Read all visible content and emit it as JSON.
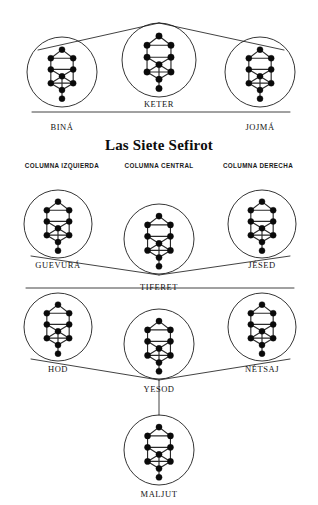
{
  "title": "Las Siete Sefirot",
  "colors": {
    "background": "#ffffff",
    "ink": "#121212",
    "node_fill": "#0a0a0a"
  },
  "column_headers": [
    {
      "id": "left",
      "label": "COLUMNA IZQUIERDA",
      "x": 62,
      "y": 168
    },
    {
      "id": "center",
      "label": "COLUMNA CENTRAL",
      "x": 159,
      "y": 168
    },
    {
      "id": "right",
      "label": "COLUMNA DERECHA",
      "x": 258,
      "y": 168
    }
  ],
  "sefirot": [
    {
      "id": "bina",
      "label": "BINÁ",
      "column": "left",
      "cx": 62,
      "cy": 72,
      "r": 35,
      "tree_scale": 0.86,
      "label_x": 62,
      "label_y": 130
    },
    {
      "id": "keter",
      "label": "KETER",
      "column": "center",
      "cx": 159,
      "cy": 60,
      "r": 37,
      "tree_scale": 0.92,
      "label_x": 159,
      "label_y": 107
    },
    {
      "id": "jojma",
      "label": "JOJMÁ",
      "column": "right",
      "cx": 260,
      "cy": 72,
      "r": 35,
      "tree_scale": 0.86,
      "label_x": 260,
      "label_y": 130
    },
    {
      "id": "guevura",
      "label": "GUEVURÁ",
      "column": "left",
      "cx": 58,
      "cy": 224,
      "r": 34,
      "tree_scale": 0.86,
      "label_x": 58,
      "label_y": 268
    },
    {
      "id": "tiferet",
      "label": "TIFERET",
      "column": "center",
      "cx": 159,
      "cy": 239,
      "r": 35,
      "tree_scale": 0.88,
      "label_x": 159,
      "label_y": 290
    },
    {
      "id": "jesed",
      "label": "JÉSED",
      "column": "right",
      "cx": 262,
      "cy": 224,
      "r": 34,
      "tree_scale": 0.86,
      "label_x": 262,
      "label_y": 268
    },
    {
      "id": "hod",
      "label": "HOD",
      "column": "left",
      "cx": 58,
      "cy": 327,
      "r": 34,
      "tree_scale": 0.86,
      "label_x": 58,
      "label_y": 372
    },
    {
      "id": "yesod",
      "label": "YESOD",
      "column": "center",
      "cx": 159,
      "cy": 344,
      "r": 35,
      "tree_scale": 0.88,
      "label_x": 159,
      "label_y": 392
    },
    {
      "id": "netsaj",
      "label": "NÉTSAJ",
      "column": "right",
      "cx": 262,
      "cy": 327,
      "r": 34,
      "tree_scale": 0.86,
      "label_x": 262,
      "label_y": 372
    },
    {
      "id": "maljut",
      "label": "MALJUT",
      "column": "center",
      "cx": 159,
      "cy": 450,
      "r": 35,
      "tree_scale": 0.88,
      "label_x": 159,
      "label_y": 497
    }
  ],
  "connectors": [
    {
      "id": "bina-to-keter",
      "x1": 38,
      "y1": 50,
      "x2": 159,
      "y2": 23
    },
    {
      "id": "keter-to-jojma",
      "x1": 159,
      "y1": 23,
      "x2": 284,
      "y2": 50
    },
    {
      "id": "bina-to-jojma",
      "x1": 32,
      "y1": 112,
      "x2": 290,
      "y2": 112
    },
    {
      "id": "guevura-to-tif",
      "x1": 31,
      "y1": 256,
      "x2": 159,
      "y2": 275
    },
    {
      "id": "tif-to-jesed",
      "x1": 159,
      "y1": 275,
      "x2": 290,
      "y2": 256
    },
    {
      "id": "guev-jesed-base",
      "x1": 26,
      "y1": 288,
      "x2": 294,
      "y2": 288
    },
    {
      "id": "hod-to-yesod",
      "x1": 31,
      "y1": 359,
      "x2": 159,
      "y2": 380
    },
    {
      "id": "yesod-to-netsaj",
      "x1": 159,
      "y1": 380,
      "x2": 290,
      "y2": 359
    },
    {
      "id": "yesod-to-maljut",
      "x1": 159,
      "y1": 380,
      "x2": 159,
      "y2": 415
    }
  ],
  "tree_graph": {
    "description": "Tree of Life glyph rendered inside every sefira circle",
    "nodes": [
      {
        "id": "n1",
        "x": 0,
        "y": -26
      },
      {
        "id": "n2",
        "x": -13,
        "y": -16
      },
      {
        "id": "n3",
        "x": 13,
        "y": -16
      },
      {
        "id": "n4",
        "x": -13,
        "y": -3
      },
      {
        "id": "n5",
        "x": 13,
        "y": -3
      },
      {
        "id": "n6",
        "x": 0,
        "y": 5
      },
      {
        "id": "n7",
        "x": -13,
        "y": 13
      },
      {
        "id": "n8",
        "x": 13,
        "y": 13
      },
      {
        "id": "n9",
        "x": 0,
        "y": 21
      },
      {
        "id": "n10",
        "x": 0,
        "y": 31
      }
    ],
    "edges": [
      [
        "n1",
        "n2"
      ],
      [
        "n1",
        "n3"
      ],
      [
        "n2",
        "n3"
      ],
      [
        "n2",
        "n4"
      ],
      [
        "n3",
        "n5"
      ],
      [
        "n4",
        "n5"
      ],
      [
        "n4",
        "n6"
      ],
      [
        "n5",
        "n6"
      ],
      [
        "n4",
        "n7"
      ],
      [
        "n5",
        "n8"
      ],
      [
        "n6",
        "n7"
      ],
      [
        "n6",
        "n8"
      ],
      [
        "n7",
        "n8"
      ],
      [
        "n7",
        "n9"
      ],
      [
        "n8",
        "n9"
      ],
      [
        "n6",
        "n9"
      ],
      [
        "n9",
        "n10"
      ]
    ],
    "node_radius": 3.5
  },
  "title_position": {
    "x": 159,
    "y": 150
  }
}
